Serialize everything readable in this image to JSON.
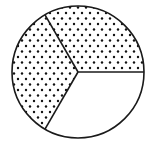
{
  "figure": {
    "title": "Circle divided into three equal parts, two shaded",
    "shape": "circle",
    "total_parts": 3,
    "shaded_parts": 2,
    "unshaded_parts": 1,
    "fraction_shaded": "2/3",
    "center": [
      78,
      72
    ],
    "radius": 66,
    "divider_angles_deg": [
      0,
      120,
      240
    ],
    "segments": [
      {
        "name": "top-right",
        "start_deg": 0,
        "end_deg": 120,
        "shaded": true
      },
      {
        "name": "left",
        "start_deg": 120,
        "end_deg": 240,
        "shaded": true
      },
      {
        "name": "bottom-right",
        "start_deg": 240,
        "end_deg": 360,
        "shaded": false
      }
    ],
    "pattern": "dots",
    "colors": {
      "stroke": "#1a1a1a",
      "dot": "#111111",
      "background": "#ffffff"
    }
  }
}
